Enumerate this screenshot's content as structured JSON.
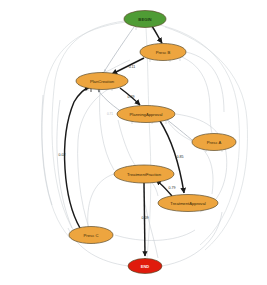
{
  "diagram": {
    "type": "directed-graph",
    "background_color": "#ffffff",
    "palette": {
      "start_node_fill": "#4f9c35",
      "start_node_stroke": "#2f6b1f",
      "activity_node_fill": "#eda53f",
      "activity_node_stroke": "#7a5c22",
      "end_node_fill": "#e01b0c",
      "end_node_stroke": "#8a1008",
      "main_edge_color": "#1a1a1a",
      "faint_edge_color": "#d2d6da",
      "edge_label_color": "#2a2a2a"
    },
    "nodes": [
      {
        "id": "begin",
        "label": "BEGIN",
        "kind": "start",
        "cx": 145,
        "cy": 19,
        "rx": 21,
        "ry": 8.5,
        "font_size": 4.2,
        "text_color": "#1d3d12"
      },
      {
        "id": "presc_b",
        "label": "Presc B",
        "kind": "activity",
        "cx": 163,
        "cy": 52,
        "rx": 23,
        "ry": 8.5,
        "font_size": 4.2,
        "text_color": "#3a2a08"
      },
      {
        "id": "plan_creation",
        "label": "PlanCreation",
        "kind": "activity",
        "cx": 102,
        "cy": 81,
        "rx": 26,
        "ry": 8.5,
        "font_size": 4.2,
        "text_color": "#3a2a08"
      },
      {
        "id": "planning_approval",
        "label": "PlanningApproval",
        "kind": "activity",
        "cx": 146,
        "cy": 114,
        "rx": 29,
        "ry": 8.5,
        "font_size": 4.2,
        "text_color": "#3a2a08"
      },
      {
        "id": "presc_a",
        "label": "Presc A",
        "kind": "activity",
        "cx": 214,
        "cy": 142,
        "rx": 22,
        "ry": 8.5,
        "font_size": 4.2,
        "text_color": "#3a2a08"
      },
      {
        "id": "treatment_fraction",
        "label": "TreatmentFraction",
        "kind": "activity",
        "cx": 144,
        "cy": 174,
        "rx": 30,
        "ry": 9.0,
        "font_size": 4.2,
        "text_color": "#3a2a08"
      },
      {
        "id": "treatment_approval",
        "label": "TreatmentApproval",
        "kind": "activity",
        "cx": 188,
        "cy": 203,
        "rx": 30,
        "ry": 8.5,
        "font_size": 4.2,
        "text_color": "#3a2a08"
      },
      {
        "id": "presc_c",
        "label": "Presc C",
        "kind": "activity",
        "cx": 91,
        "cy": 235,
        "rx": 22,
        "ry": 8.5,
        "font_size": 4.2,
        "text_color": "#3a2a08"
      },
      {
        "id": "end",
        "label": "END",
        "kind": "end",
        "cx": 145,
        "cy": 266,
        "rx": 17,
        "ry": 7.5,
        "font_size": 4.0,
        "text_color": "#ffeeee"
      }
    ],
    "edges": [
      {
        "id": "e1",
        "from": "begin",
        "to": "presc_b",
        "label": "",
        "weight_label": "",
        "prominent": true
      },
      {
        "id": "e2",
        "from": "begin",
        "to": "plan_creation",
        "label": "",
        "weight_label": "",
        "prominent": false
      },
      {
        "id": "e3",
        "from": "presc_b",
        "to": "plan_creation",
        "label": "0.11",
        "weight_label": "0.11",
        "prominent": true
      },
      {
        "id": "e4",
        "from": "plan_creation",
        "to": "planning_approval",
        "label": "0.49",
        "weight_label": "0.49",
        "prominent": true
      },
      {
        "id": "e5",
        "from": "planning_approval",
        "to": "plan_creation",
        "label": "0.71",
        "weight_label": "0.71",
        "prominent": false
      },
      {
        "id": "e6",
        "from": "planning_approval",
        "to": "treatment_approval",
        "label": "0.85",
        "weight_label": "0.85",
        "prominent": true
      },
      {
        "id": "e7",
        "from": "presc_a",
        "to": "planning_approval",
        "label": "",
        "weight_label": "",
        "prominent": false
      },
      {
        "id": "e8",
        "from": "treatment_approval",
        "to": "treatment_fraction",
        "label": "0.79",
        "weight_label": "0.79",
        "prominent": true
      },
      {
        "id": "e9",
        "from": "treatment_fraction",
        "to": "end",
        "label": "0.09",
        "weight_label": "0.09",
        "prominent": true
      },
      {
        "id": "e10",
        "from": "presc_c",
        "to": "plan_creation",
        "label": "0.02",
        "weight_label": "0.02",
        "prominent": true
      }
    ],
    "edge_labels": [
      {
        "id": "l_pb_pc",
        "text": "0.11",
        "x": 132,
        "y": 67
      },
      {
        "id": "l_pc_pa",
        "text": "0.49",
        "x": 131,
        "y": 97
      },
      {
        "id": "l_pa_pc",
        "text": "0.71",
        "x": 110,
        "y": 114
      },
      {
        "id": "l_pa_ta",
        "text": "0.85",
        "x": 180,
        "y": 157
      },
      {
        "id": "l_ta_tf",
        "text": "0.79",
        "x": 172,
        "y": 188
      },
      {
        "id": "l_tf_end",
        "text": "0.09",
        "x": 145,
        "y": 218
      },
      {
        "id": "l_pcc_pc",
        "text": "0.02",
        "x": 62,
        "y": 155
      }
    ]
  }
}
